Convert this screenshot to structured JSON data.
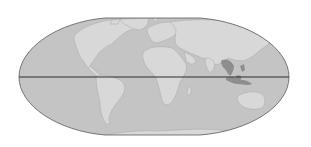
{
  "map": {
    "projection": "flat-polar elliptical (world)",
    "colors": {
      "background": "#ffffff",
      "ocean": "#c4c4c4",
      "land": "#d8d8d8",
      "land_border": "#a8a8a8",
      "highlight_region": "#8e8e8e",
      "outline": "#5a5a5a",
      "equator": "#2a2a2a"
    },
    "frame": {
      "left_x": 19,
      "right_x": 289,
      "center_y": 77,
      "top_y": 18,
      "bottom_y": 135,
      "flat_top_from_x": 105,
      "flat_top_to_x": 200
    },
    "features": {
      "equator_line": true,
      "highlighted_region": "Southeast Asia (Indochina, Malaysia, Indonesia, Philippines)"
    },
    "labels": []
  }
}
